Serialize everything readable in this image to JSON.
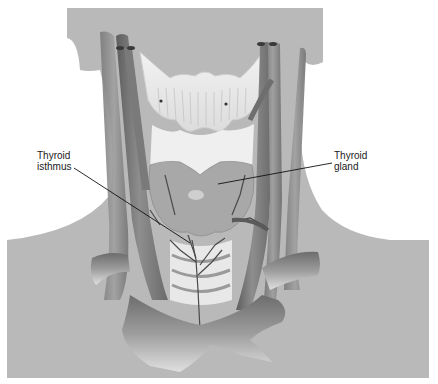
{
  "figure": {
    "labels": [
      {
        "id": "isthmus",
        "line1": "Thyroid",
        "line2": "isthmus"
      },
      {
        "id": "gland",
        "line1": "Thyroid",
        "line2": "gland"
      }
    ]
  },
  "colors": {
    "background": "#ffffff",
    "skin_silhouette": "#b9b9b9",
    "vessel_dark": "#6f6f6f",
    "vessel_mid": "#8a8a8a",
    "vessel_light": "#a6a6a6",
    "cartilage": "#ececec",
    "thyroid": "#a9a9a9",
    "leader_line": "#111111"
  }
}
